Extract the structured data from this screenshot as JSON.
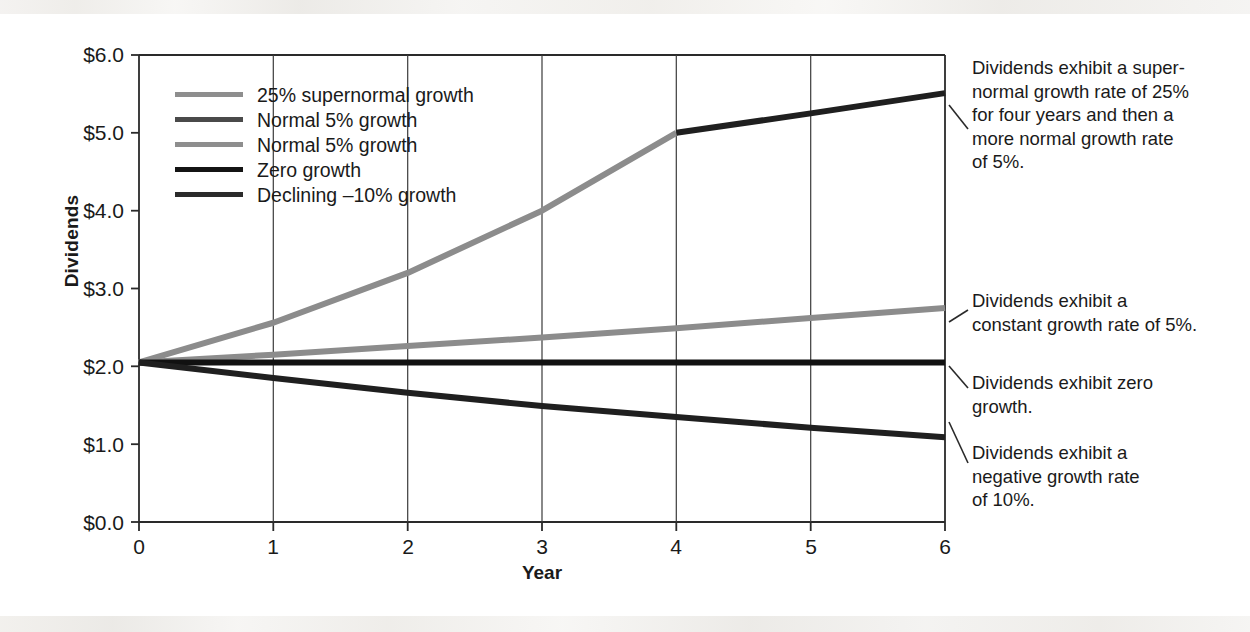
{
  "chart_data": {
    "type": "line",
    "title": "",
    "xlabel": "Year",
    "ylabel": "Dividends",
    "xlim": [
      0,
      6
    ],
    "ylim": [
      0.0,
      6.0
    ],
    "grid": "vertical-gridlines-at-each-year",
    "legend_position": "inside-upper-left",
    "x": [
      0,
      1,
      2,
      3,
      4,
      5,
      6
    ],
    "y_ticks": [
      0.0,
      1.0,
      2.0,
      3.0,
      4.0,
      5.0,
      6.0
    ],
    "y_tick_labels": [
      "$0.0",
      "$1.0",
      "$2.0",
      "$3.0",
      "$4.0",
      "$5.0",
      "$6.0"
    ],
    "x_ticks": [
      0,
      1,
      2,
      3,
      4,
      5,
      6
    ],
    "x_tick_labels": [
      "0",
      "1",
      "2",
      "3",
      "4",
      "5",
      "6"
    ],
    "initial_dividend": 2.05,
    "series": [
      {
        "name": "25% supernormal growth",
        "color": "#8c8c8c",
        "width": 6,
        "x": [
          0,
          1,
          2,
          3,
          4
        ],
        "values": [
          2.05,
          2.56,
          3.2,
          4.0,
          5.0
        ]
      },
      {
        "name": "Normal 5% growth",
        "color": "#1f1f1f",
        "width": 6,
        "x": [
          4,
          5,
          6
        ],
        "values": [
          5.0,
          5.25,
          5.51
        ]
      },
      {
        "name": "Normal 5% growth",
        "color": "#8c8c8c",
        "width": 6,
        "x": [
          0,
          1,
          2,
          3,
          4,
          5,
          6
        ],
        "values": [
          2.05,
          2.15,
          2.26,
          2.37,
          2.49,
          2.62,
          2.75
        ]
      },
      {
        "name": "Zero growth",
        "color": "#111111",
        "width": 6,
        "x": [
          0,
          1,
          2,
          3,
          4,
          5,
          6
        ],
        "values": [
          2.05,
          2.05,
          2.05,
          2.05,
          2.05,
          2.05,
          2.05
        ]
      },
      {
        "name": "Declining –10% growth",
        "color": "#1f1f1f",
        "width": 6,
        "x": [
          0,
          1,
          2,
          3,
          4,
          5,
          6
        ],
        "values": [
          2.05,
          1.85,
          1.66,
          1.49,
          1.35,
          1.21,
          1.09
        ]
      }
    ],
    "annotations": [
      {
        "id": "supernormal-note",
        "text": "Dividends exhibit a super-normal growth rate of 25% for four years and then a more normal growth rate of 5%.",
        "lines": [
          "Dividends exhibit a super-",
          "normal growth rate of 25%",
          "for four years and then a",
          "more normal growth rate",
          "of 5%."
        ],
        "points_to": "25% supernormal growth"
      },
      {
        "id": "constant-growth-note",
        "text": "Dividends exhibit a constant growth rate of 5%.",
        "lines": [
          "Dividends exhibit a",
          "constant growth rate of 5%."
        ],
        "points_to": "Normal 5% growth"
      },
      {
        "id": "zero-growth-note",
        "text": "Dividends exhibit zero growth.",
        "lines": [
          "Dividends exhibit zero",
          "growth."
        ],
        "points_to": "Zero growth"
      },
      {
        "id": "negative-growth-note",
        "text": "Dividends exhibit a negative growth rate of 10%.",
        "lines": [
          "Dividends exhibit a",
          "negative growth rate",
          "of 10%."
        ],
        "points_to": "Declining –10% growth"
      }
    ]
  },
  "legend": {
    "items": [
      {
        "label": "25% supernormal growth",
        "color": "#8e8e8e"
      },
      {
        "label": "Normal 5% growth",
        "color": "#4a4a4a"
      },
      {
        "label": "Normal 5% growth",
        "color": "#8e8e8e"
      },
      {
        "label": "Zero growth",
        "color": "#141414"
      },
      {
        "label": "Declining –10% growth",
        "color": "#2b2b2b"
      }
    ]
  },
  "axes": {
    "y_title": "Dividends",
    "x_title": "Year",
    "y_labels": [
      "$6.0",
      "$5.0",
      "$4.0",
      "$3.0",
      "$2.0",
      "$1.0",
      "$0.0"
    ],
    "x_labels": [
      "0",
      "1",
      "2",
      "3",
      "4",
      "5",
      "6"
    ]
  },
  "annotation_text": {
    "a0_l0": "Dividends exhibit a super-",
    "a0_l1": "normal growth rate of 25%",
    "a0_l2": "for four years and then a",
    "a0_l3": "more normal growth rate",
    "a0_l4": "of 5%.",
    "a1_l0": "Dividends exhibit a",
    "a1_l1": "constant growth rate of 5%.",
    "a2_l0": "Dividends exhibit zero",
    "a2_l1": "growth.",
    "a3_l0": "Dividends exhibit a",
    "a3_l1": "negative growth rate",
    "a3_l2": "of 10%."
  },
  "colors": {
    "axis": "#2a2a2a",
    "gridline": "#3a3a3a",
    "text": "#1a1a1a",
    "background": "#ffffff"
  }
}
